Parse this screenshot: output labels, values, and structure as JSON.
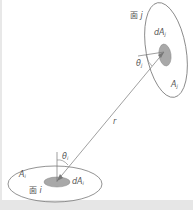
{
  "diagram": {
    "surface_j": {
      "face_label": "面",
      "face_index": "j",
      "area_label": "A",
      "area_sub": "j",
      "element_label": "dA",
      "element_sub": "j",
      "angle_label": "θ",
      "angle_sub": "j"
    },
    "surface_i": {
      "face_label": "面",
      "face_index": "i",
      "area_label": "A",
      "area_sub": "i",
      "element_label": "dA",
      "element_sub": "i",
      "angle_label": "θ",
      "angle_sub": "i"
    },
    "distance_label": "r",
    "colors": {
      "line": "#777777",
      "shaded": "#a8a8a8",
      "background": "#ffffff",
      "band": "#e6e6e6"
    }
  }
}
